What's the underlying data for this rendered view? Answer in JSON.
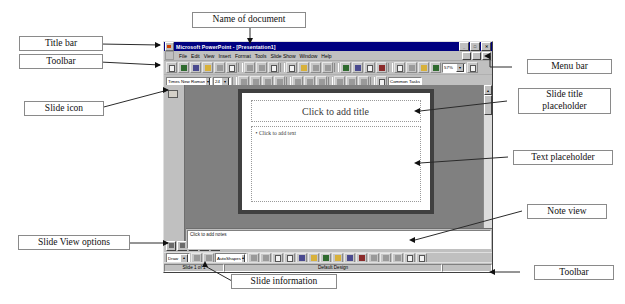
{
  "annotations": {
    "name_of_document": "Name of document",
    "title_bar": "Title bar",
    "toolbar_left": "Toolbar",
    "slide_icon": "Slide icon",
    "slide_view_options": "Slide View options",
    "slide_information": "Slide information",
    "menu_bar": "Menu bar",
    "slide_title_placeholder": "Slide title\nplaceholder",
    "slide_title_placeholder_line1": "Slide title",
    "slide_title_placeholder_line2": "placeholder",
    "text_placeholder": "Text placeholder",
    "note_view": "Note view",
    "toolbar_right": "Toolbar"
  },
  "app": {
    "title_bar": {
      "app_name": "Microsoft PowerPoint - [Presentation1]",
      "icon": "powerpoint-icon",
      "minimize": "_",
      "restore": "□",
      "close": "✕",
      "doc_minimize": "_",
      "doc_restore": "□",
      "doc_close": "✕"
    },
    "menu_bar": {
      "items": [
        {
          "label": "File"
        },
        {
          "label": "Edit"
        },
        {
          "label": "View"
        },
        {
          "label": "Insert"
        },
        {
          "label": "Format"
        },
        {
          "label": "Tools"
        },
        {
          "label": "Slide Show"
        },
        {
          "label": "Window"
        },
        {
          "label": "Help"
        }
      ]
    },
    "standard_toolbar": {
      "buttons": [
        "new-icon",
        "open-icon",
        "save-icon",
        "mail-icon",
        "print-icon",
        "print-preview-icon",
        "spelling-icon",
        "cut-icon",
        "copy-icon",
        "paste-icon",
        "format-painter-icon",
        "undo-icon",
        "redo-icon",
        "insert-hyperlink-icon",
        "tables-and-borders-icon",
        "insert-table-icon",
        "insert-chart-icon",
        "new-slide-icon",
        "expand-all-icon",
        "show-formatting-icon",
        "show-hide-grid-icon",
        "animation-effects-icon"
      ],
      "zoom_value": "57%",
      "zoom_icon": "chevron-down-icon",
      "help_icon": "office-assistant-icon"
    },
    "formatting_toolbar": {
      "font_name": "Times New Roman",
      "font_size": "24",
      "buttons": [
        "bold-icon",
        "italic-icon",
        "underline-icon",
        "shadow-icon",
        "align-left-icon",
        "align-center-icon",
        "align-right-icon",
        "bullets-icon",
        "increase-font-icon",
        "decrease-font-icon",
        "promote-icon",
        "demote-icon"
      ],
      "common_tasks": "Common Tasks"
    },
    "slide": {
      "title_placeholder": "Click to add title",
      "body_placeholder_bullet": "•",
      "body_placeholder": "Click to add text"
    },
    "notes_pane": {
      "placeholder": "Click to add notes"
    },
    "drawing_toolbar": {
      "draw_label": "Draw",
      "draw_arrow": "chevron-up-icon",
      "autoshapes_label": "AutoShapes",
      "autoshapes_arrow": "chevron-up-icon",
      "buttons": [
        "select-arrow-icon",
        "free-rotate-icon",
        "line-icon",
        "arrow-icon",
        "rectangle-icon",
        "oval-icon",
        "text-box-icon",
        "wordart-icon",
        "clipart-icon",
        "fill-color-icon",
        "line-color-icon",
        "font-color-icon",
        "line-style-icon",
        "dash-style-icon",
        "arrow-style-icon",
        "shadow-icon",
        "3d-icon"
      ]
    },
    "status_bar": {
      "slide_info": "Slide 1 of 1",
      "design_name": "Default Design",
      "extra": ""
    },
    "view_buttons": [
      "normal-view-icon",
      "outline-view-icon",
      "slide-view-icon",
      "slide-sorter-view-icon",
      "slide-show-view-icon"
    ]
  },
  "colors": {
    "titlebar_blue": "#000080",
    "window_gray": "#c0c0c0",
    "workspace_gray": "#808080",
    "slide_white": "#ffffff",
    "callout_border": "#8a8a8a",
    "leader_line": "#2b2b2b"
  }
}
